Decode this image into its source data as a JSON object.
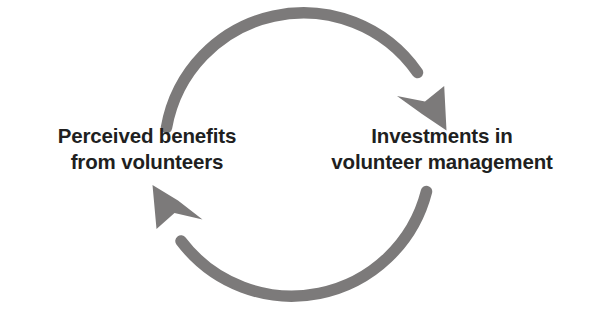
{
  "diagram": {
    "type": "cycle",
    "title": "",
    "background_color": "#ffffff",
    "arrow_color": "#7c7a7a",
    "text_color": "#211f1f",
    "nodes": [
      {
        "id": "perceived-benefits",
        "position": "left",
        "lines": [
          "Perceived benefits",
          "from volunteers"
        ]
      },
      {
        "id": "investments",
        "position": "right",
        "lines": [
          "Investments in",
          "volunteer management"
        ]
      }
    ],
    "arrows": [
      {
        "id": "top-arrow",
        "from": "perceived-benefits",
        "to": "investments",
        "direction": "clockwise",
        "arrowhead_at": "end",
        "arrowhead_points": "down-right"
      },
      {
        "id": "bottom-arrow",
        "from": "investments",
        "to": "perceived-benefits",
        "direction": "clockwise",
        "arrowhead_at": "end",
        "arrowhead_points": "up-left"
      }
    ]
  }
}
